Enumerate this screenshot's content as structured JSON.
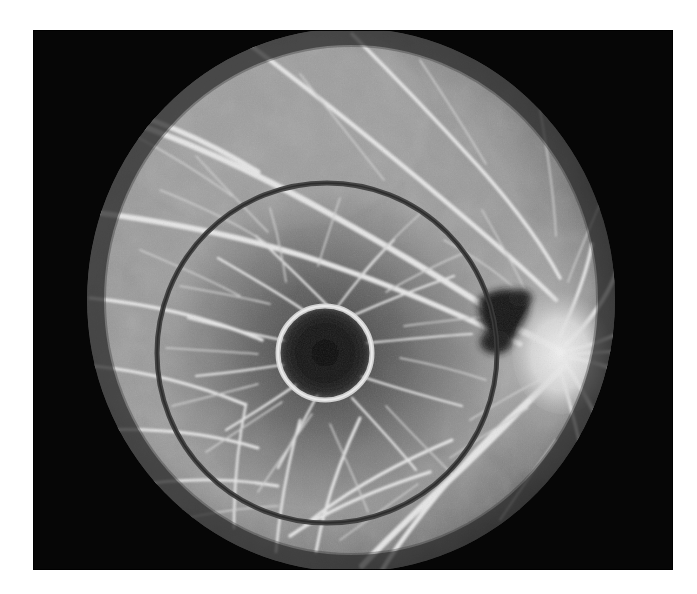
{
  "domain": "Natural-Image",
  "figure": {
    "name": "fundus-fluorescein-angiogram",
    "modality": "Fundus fluorescein angiography",
    "eye_laterality": "right-eye",
    "caption": "",
    "description": "Grayscale fundus fluorescein angiogram of the posterior pole showing hyperfluorescent retinal vessels radiating from the optic disc, a dark foveal avascular zone, and two superimposed circular measurement overlays centred on the fovea."
  },
  "canvas": {
    "width": 697,
    "height": 594,
    "page_background": "#ffffff",
    "photo_frame": {
      "x": 33,
      "y": 30,
      "width": 640,
      "height": 540,
      "background": "#060606",
      "corner_vignette": "#000000"
    }
  },
  "fundus": {
    "name": "fundus-disc",
    "center_x": 351,
    "center_y": 300,
    "radius_x": 264,
    "radius_y": 272,
    "base_gray": "#9a9a9a",
    "edge_gray": "#4b4b4b",
    "texture": "granular-film-grain"
  },
  "features": {
    "optic_disc": {
      "name": "optic-disc",
      "center_x": 562,
      "center_y": 352,
      "radius_x": 46,
      "radius_y": 58,
      "brightness": "#e8e8e8",
      "label": "Optic disc"
    },
    "fovea": {
      "name": "foveal-avascular-zone",
      "center_x": 325,
      "center_y": 353,
      "radius": 45,
      "fill": "#171717",
      "label": "Foveal avascular zone"
    },
    "hemorrhage": {
      "name": "dark-lesion",
      "center_x": 505,
      "center_y": 312,
      "fill": "#171717",
      "label": "Hypofluorescent lesion / haemorrhage"
    },
    "macular_darkening": {
      "name": "macular-dark-zone",
      "center_x": 330,
      "center_y": 356,
      "radius_x": 175,
      "radius_y": 165,
      "fill": "#4a4a4a"
    }
  },
  "overlays": {
    "outer_ring": {
      "name": "outer-measurement-ring",
      "center_x": 327,
      "center_y": 353,
      "radius": 170,
      "stroke_width": 5,
      "stroke_color": "#3c3c3c",
      "label": "Outer circle overlay"
    },
    "inner_ring": {
      "name": "inner-measurement-ring",
      "center_x": 325,
      "center_y": 353,
      "radius": 47,
      "stroke_width": 5,
      "stroke_color": "#d8d8d8",
      "label": "Inner circle overlay"
    }
  },
  "vessels": {
    "stroke_color": "#e6e6e6",
    "fine_stroke_color": "#c8c8c8",
    "arcade_label": "Retinal vascular arcades",
    "origin_x": 562,
    "origin_y": 352
  }
}
